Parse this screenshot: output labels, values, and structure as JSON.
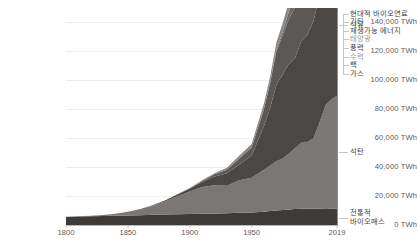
{
  "chart_data": {
    "type": "area",
    "title": "",
    "subtitle": "",
    "xlabel": "",
    "ylabel": "",
    "stacked": true,
    "grid": true,
    "legend_position": "right-inline",
    "xlim": [
      1800,
      2019
    ],
    "ylim": [
      0,
      150000
    ],
    "y_unit": "TWh",
    "y_ticks": [
      {
        "value": 0,
        "label": "0 TWh"
      },
      {
        "value": 20000,
        "label": "20,000 TWh"
      },
      {
        "value": 40000,
        "label": "40,000 TWh"
      },
      {
        "value": 60000,
        "label": "60,000 TWh"
      },
      {
        "value": 80000,
        "label": "80,000 TWh"
      },
      {
        "value": 100000,
        "label": "100,000 TWh"
      },
      {
        "value": 120000,
        "label": "120,000 TWh"
      },
      {
        "value": 140000,
        "label": "140,000 TWh"
      }
    ],
    "x_ticks": [
      {
        "value": 1800,
        "label": "1800"
      },
      {
        "value": 1850,
        "label": "1850"
      },
      {
        "value": 1900,
        "label": "1900"
      },
      {
        "value": 1950,
        "label": "1950"
      },
      {
        "value": 2019,
        "label": "2019"
      }
    ],
    "x": [
      1800,
      1810,
      1820,
      1830,
      1840,
      1850,
      1860,
      1870,
      1880,
      1890,
      1900,
      1910,
      1920,
      1930,
      1940,
      1950,
      1960,
      1965,
      1970,
      1975,
      1980,
      1985,
      1990,
      1995,
      2000,
      2005,
      2010,
      2015,
      2019
    ],
    "series": [
      {
        "name": "전통적 바이오매스",
        "key": "traditional_biomass",
        "color": "#3e3a38",
        "values": [
          5600,
          5800,
          6000,
          6200,
          6400,
          6600,
          6800,
          7000,
          7200,
          7400,
          7600,
          7800,
          8000,
          8200,
          8400,
          8600,
          9200,
          9600,
          10000,
          10400,
          10800,
          11100,
          11300,
          11400,
          11300,
          11200,
          11100,
          11200,
          11300
        ]
      },
      {
        "name": "석탄",
        "key": "coal",
        "color": "#7a7775",
        "values": [
          100,
          200,
          400,
          700,
          1400,
          2500,
          4200,
          6300,
          9000,
          12500,
          15500,
          18500,
          19500,
          19000,
          22500,
          24000,
          29000,
          31500,
          34000,
          35500,
          38500,
          42000,
          45500,
          46000,
          48500,
          60000,
          72000,
          76000,
          78000
        ]
      },
      {
        "name": "석유",
        "key": "oil",
        "color": "#4b4745",
        "values": [
          0,
          0,
          0,
          0,
          0,
          0,
          100,
          300,
          700,
          1200,
          2000,
          3500,
          6000,
          8500,
          11000,
          15500,
          30000,
          40000,
          53000,
          58000,
          62000,
          62000,
          70000,
          74000,
          81000,
          88000,
          91000,
          95000,
          98000
        ]
      },
      {
        "name": "가스",
        "key": "gas",
        "color": "#5c5856",
        "values": [
          0,
          0,
          0,
          0,
          0,
          0,
          0,
          0,
          50,
          150,
          300,
          700,
          1500,
          2500,
          4000,
          5500,
          12000,
          17000,
          23000,
          27000,
          31000,
          35000,
          41000,
          44000,
          49000,
          55000,
          62000,
          66000,
          70000
        ]
      },
      {
        "name": "핵",
        "key": "nuclear",
        "color": "#6d6a68",
        "values": [
          0,
          0,
          0,
          0,
          0,
          0,
          0,
          0,
          0,
          0,
          0,
          0,
          0,
          0,
          0,
          0,
          200,
          500,
          1000,
          2500,
          5000,
          9000,
          12000,
          13500,
          14500,
          15000,
          15500,
          14000,
          15500
        ]
      },
      {
        "name": "수력",
        "key": "hydro",
        "color": "#8a8785",
        "values": [
          0,
          0,
          0,
          0,
          0,
          0,
          0,
          0,
          0,
          50,
          150,
          400,
          800,
          1300,
          1900,
          2400,
          3500,
          4200,
          5000,
          5700,
          6300,
          7200,
          8000,
          8800,
          9500,
          10300,
          12000,
          13000,
          13800
        ]
      },
      {
        "name": "풍력",
        "key": "wind",
        "color": "#9d9a98",
        "values": [
          0,
          0,
          0,
          0,
          0,
          0,
          0,
          0,
          0,
          0,
          0,
          0,
          0,
          0,
          0,
          0,
          0,
          0,
          0,
          0,
          0,
          0,
          100,
          200,
          500,
          1100,
          2500,
          5500,
          8000
        ]
      },
      {
        "name": "태양광",
        "key": "solar",
        "color": "#b0adab",
        "values": [
          0,
          0,
          0,
          0,
          0,
          0,
          0,
          0,
          0,
          0,
          0,
          0,
          0,
          0,
          0,
          0,
          0,
          0,
          0,
          0,
          0,
          0,
          0,
          0,
          50,
          100,
          400,
          2000,
          5000
        ]
      },
      {
        "name": "재생가능 에너지",
        "key": "other_renewables",
        "color": "#807d7b",
        "values": [
          0,
          0,
          0,
          0,
          0,
          0,
          0,
          0,
          0,
          0,
          0,
          0,
          0,
          0,
          0,
          0,
          0,
          0,
          100,
          200,
          400,
          700,
          1000,
          1300,
          1700,
          2200,
          2800,
          3300,
          3800
        ]
      },
      {
        "name": "기타",
        "key": "other",
        "color": "#949190",
        "values": [
          0,
          0,
          0,
          0,
          0,
          0,
          0,
          0,
          0,
          0,
          0,
          0,
          0,
          0,
          0,
          0,
          0,
          0,
          0,
          0,
          0,
          0,
          0,
          0,
          100,
          200,
          400,
          700,
          1000
        ]
      },
      {
        "name": "현대적 바이오연료",
        "key": "modern_biofuels",
        "color": "#a8a5a3",
        "values": [
          0,
          0,
          0,
          0,
          0,
          0,
          0,
          0,
          0,
          0,
          0,
          0,
          0,
          0,
          0,
          0,
          0,
          0,
          0,
          0,
          50,
          100,
          200,
          300,
          500,
          900,
          1500,
          2000,
          2400
        ]
      }
    ]
  },
  "legend": {
    "top_labels": [
      {
        "text": "현대적 바이오연료",
        "dim": false
      },
      {
        "text": "기타",
        "dim": false
      },
      {
        "text": "재생가능 에너지",
        "dim": false
      },
      {
        "text": "태양광",
        "dim": true
      },
      {
        "text": "풍력",
        "dim": false
      },
      {
        "text": "수력",
        "dim": true
      },
      {
        "text": "핵",
        "dim": false
      },
      {
        "text": "가스",
        "dim": false
      }
    ],
    "oil_label": "석유",
    "coal_label": "석탄",
    "biomass_label_line1": "전통적",
    "biomass_label_line2": "바이오매스"
  }
}
